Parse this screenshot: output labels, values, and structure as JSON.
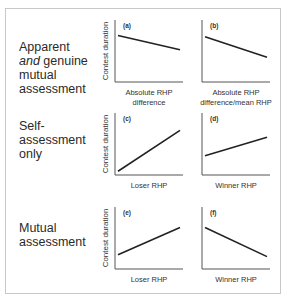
{
  "rows": [
    {
      "label_parts": [
        {
          "text": "Apparent",
          "italic": false
        },
        {
          "text": "and",
          "italic": true
        },
        {
          "text": " genuine",
          "italic": false
        },
        {
          "text": "mutual",
          "italic": false
        },
        {
          "text": "assessment",
          "italic": false
        }
      ]
    },
    {
      "label_parts": [
        {
          "text": "Self-"
        },
        {
          "text": "assessment"
        },
        {
          "text": "only"
        }
      ]
    },
    {
      "label_parts": [
        {
          "text": "Mutual"
        },
        {
          "text": "assessment"
        }
      ]
    }
  ],
  "row_labels": {
    "r0_l1": "Apparent",
    "r0_l2_italic": "and",
    "r0_l2_rest": " genuine",
    "r0_l3": "mutual",
    "r0_l4": "assessment",
    "r1_l1": "Self-",
    "r1_l2": "assessment",
    "r1_l3": "only",
    "r2_l1": "Mutual",
    "r2_l2": "assessment"
  },
  "chart_data": [
    {
      "type": "line",
      "panel": "(a)",
      "ylabel": "Contest duration",
      "xlabel": [
        "Absolute RHP",
        "difference"
      ],
      "x": [
        0,
        1
      ],
      "y": [
        0.75,
        0.52
      ],
      "trend": "negative"
    },
    {
      "type": "line",
      "panel": "(b)",
      "ylabel": "",
      "xlabel": [
        "Absolute RHP",
        "difference/mean RHP"
      ],
      "x": [
        0,
        1
      ],
      "y": [
        0.73,
        0.4
      ],
      "trend": "negative"
    },
    {
      "type": "line",
      "panel": "(c)",
      "ylabel": "Contest duration",
      "xlabel": [
        "Loser RHP"
      ],
      "x": [
        0,
        1
      ],
      "y": [
        0.06,
        0.72
      ],
      "trend": "positive"
    },
    {
      "type": "line",
      "panel": "(d)",
      "ylabel": "",
      "xlabel": [
        "Winner RHP"
      ],
      "x": [
        0,
        1
      ],
      "y": [
        0.31,
        0.61
      ],
      "trend": "positive"
    },
    {
      "type": "line",
      "panel": "(e)",
      "ylabel": "Contest duration",
      "xlabel": [
        "Loser RHP"
      ],
      "x": [
        0,
        1
      ],
      "y": [
        0.23,
        0.67
      ],
      "trend": "positive"
    },
    {
      "type": "line",
      "panel": "(f)",
      "ylabel": "",
      "xlabel": [
        "Winner RHP"
      ],
      "x": [
        0,
        1
      ],
      "y": [
        0.67,
        0.2
      ],
      "trend": "negative"
    }
  ]
}
